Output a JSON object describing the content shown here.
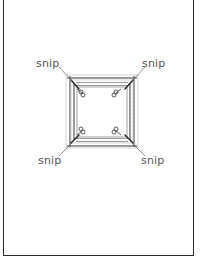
{
  "diagram": {
    "title": "",
    "labels": {
      "top_left": "snip",
      "top_right": "snip",
      "bottom_left": "snip",
      "bottom_right": "snip"
    },
    "icons": [
      "scissors-icon",
      "scissors-icon",
      "scissors-icon",
      "scissors-icon"
    ],
    "colors": {
      "line": "#2a2a2a",
      "zigzag": "#555555",
      "label": "#555555",
      "background": "#ffffff"
    }
  }
}
